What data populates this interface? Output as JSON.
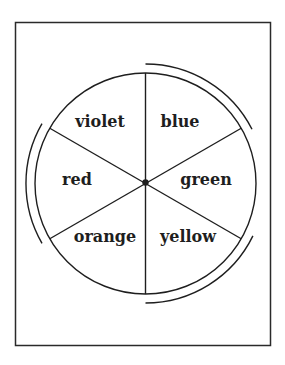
{
  "diagram": {
    "type": "color-wheel",
    "frame": {
      "x": 15.5,
      "y": 22.5,
      "width": 255,
      "height": 323
    },
    "wheel": {
      "cx": 145.5,
      "cy": 183.5,
      "r": 110.5,
      "outer_arc_r": 119.5
    },
    "segments": [
      {
        "label": "violet",
        "x": 100,
        "y": 127
      },
      {
        "label": "blue",
        "x": 180,
        "y": 127
      },
      {
        "label": "red",
        "x": 77,
        "y": 185
      },
      {
        "label": "green",
        "x": 206,
        "y": 185
      },
      {
        "label": "orange",
        "x": 105,
        "y": 242
      },
      {
        "label": "yellow",
        "x": 188,
        "y": 242
      }
    ],
    "outer_arcs": [
      {
        "name": "arc-violet-red-orange-left",
        "from_deg": 150,
        "to_deg": 210
      },
      {
        "name": "arc-blue-green-upper-right",
        "from_deg": -90,
        "to_deg": -27
      },
      {
        "name": "arc-yellow-lower-right",
        "from_deg": 26,
        "to_deg": 90
      }
    ],
    "colors": {
      "stroke": "#1e1e1e",
      "background": "#ffffff"
    }
  }
}
